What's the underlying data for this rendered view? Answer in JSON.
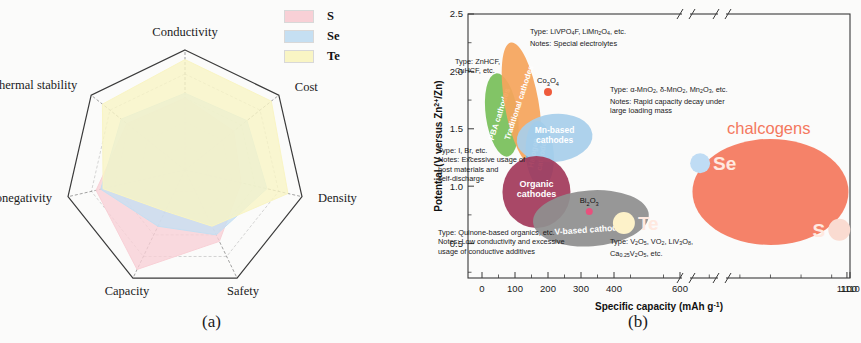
{
  "figure": {
    "panel_a_caption": "(a)",
    "panel_b_caption": "(b)"
  },
  "panel_a": {
    "type": "radar",
    "legend": [
      {
        "name": "S",
        "color": "#f8d0d6"
      },
      {
        "name": "Se",
        "color": "#c5dff2"
      },
      {
        "name": "Te",
        "color": "#f9f5c4"
      }
    ],
    "axes": [
      "Conductivity",
      "Cost",
      "Density",
      "Safety",
      "Capacity",
      "Electronegativity",
      "Thermal stability"
    ]
  },
  "panel_b": {
    "y_axis_title": "Potential (V versus Zn",
    "y_axis_title_sup": "2+",
    "y_axis_title_tail": "/Zn)",
    "x_axis_title": "Specific capacity (mAh g",
    "x_axis_title_sup": "-1",
    "x_axis_title_tail": ")",
    "x_ticks": [
      "0",
      "100",
      "200",
      "300",
      "400",
      "600",
      "1100",
      "1110"
    ],
    "y_ticks": [
      "0.5",
      "1.0",
      "1.5",
      "2.0",
      "2.5"
    ],
    "chalcogens_title": "chalcogens",
    "bubbles": [
      {
        "label": "PBA cathodes",
        "color": "#79c05a"
      },
      {
        "label": "Traditional cathodes",
        "color": "#f5a55c"
      },
      {
        "label": "Halogen cathodes",
        "color": "#62b8e8"
      },
      {
        "label": "Mn-based cathodes",
        "color": "#a8cfeb"
      },
      {
        "label": "Organic cathodes",
        "color": "#a33a5b"
      },
      {
        "label": "V-based cathodes",
        "color": "#8f8f8f"
      },
      {
        "label": "chalcogens",
        "color": "#f4785e"
      }
    ],
    "points": [
      {
        "label": "Co3O4",
        "color": "#ef5b3c"
      },
      {
        "label": "Bi2O3",
        "color": "#e8507d"
      },
      {
        "label": "Se",
        "color": "#bfdcf4"
      },
      {
        "label": "Te",
        "color": "#fdf2c9"
      },
      {
        "label": "S",
        "color": "#fadbd1"
      }
    ],
    "annotations": [
      {
        "id": "pba",
        "text": "Type: ZnHCF,\nCuHCF, etc."
      },
      {
        "id": "traditional",
        "text": "Type: LiVPO4F, LiMn2O4, etc.\nNotes: Special electrolytes"
      },
      {
        "id": "mn",
        "text": "Type: a-MnO2, d-MnO2, Mn2O3, etc.\nNotes: Rapid capacity decay under\nlarge loading mass"
      },
      {
        "id": "halogen",
        "text": "Type: I, Br, etc.\nNotes: Excessive usage of\nhost materials and\nself-discharge"
      },
      {
        "id": "organic",
        "text": "Type: Quinone-based organics, etc.\nNotes: Low conductivity and excessive\nusage of conductive additives"
      },
      {
        "id": "vanadium",
        "text": "Type: V2O5, VO2, LiV3O8,\nCa0.25V2O5, etc."
      }
    ]
  },
  "chart_data": [
    {
      "type": "radar",
      "title": "",
      "categories": [
        "Conductivity",
        "Cost",
        "Density",
        "Safety",
        "Capacity",
        "Electronegativity",
        "Thermal stability"
      ],
      "rmax": 5,
      "grid": true,
      "legend_position": "top-right",
      "series": [
        {
          "name": "S",
          "color": "#f8d0d6",
          "values": [
            3.0,
            2.6,
            2.4,
            3.3,
            4.6,
            3.8,
            3.1
          ]
        },
        {
          "name": "Se",
          "color": "#c5dff2",
          "values": [
            3.2,
            3.3,
            3.5,
            3.0,
            2.6,
            3.6,
            3.4
          ]
        },
        {
          "name": "Te",
          "color": "#f9f5c4",
          "values": [
            4.6,
            4.6,
            4.4,
            2.6,
            1.9,
            3.5,
            4.4
          ]
        }
      ]
    },
    {
      "type": "scatter",
      "title": "",
      "xlabel": "Specific capacity (mAh g-1)",
      "ylabel": "Potential (V versus Zn2+/Zn)",
      "xlim": [
        -40,
        1110
      ],
      "ylim": [
        0.2,
        2.5
      ],
      "x_ticks": [
        0,
        100,
        200,
        300,
        400,
        600,
        1100,
        1110
      ],
      "y_ticks": [
        0.5,
        1.0,
        1.5,
        2.0,
        2.5
      ],
      "axis_breaks": [
        "after 600",
        "before 1100"
      ],
      "grid": false,
      "legend_position": "none",
      "bubbles": [
        {
          "name": "PBA cathodes",
          "x": 60,
          "y": 1.62,
          "color": "#79c05a"
        },
        {
          "name": "Traditional cathodes",
          "x": 120,
          "y": 1.72,
          "color": "#f5a55c"
        },
        {
          "name": "Halogen cathodes",
          "x": 175,
          "y": 1.28,
          "color": "#62b8e8"
        },
        {
          "name": "Mn-based cathodes",
          "x": 220,
          "y": 1.42,
          "color": "#a8cfeb"
        },
        {
          "name": "Organic cathodes",
          "x": 165,
          "y": 0.95,
          "color": "#a33a5b"
        },
        {
          "name": "V-based cathodes",
          "x": 330,
          "y": 0.72,
          "color": "#8f8f8f"
        },
        {
          "name": "chalcogens",
          "x": 850,
          "y": 0.95,
          "color": "#f4785e"
        }
      ],
      "points": [
        {
          "name": "Co3O4",
          "x": 200,
          "y": 1.82,
          "color": "#ef5b3c"
        },
        {
          "name": "Bi2O3",
          "x": 325,
          "y": 0.78,
          "color": "#e8507d"
        },
        {
          "name": "Se",
          "x": 620,
          "y": 1.2,
          "color": "#bfdcf4"
        },
        {
          "name": "Te",
          "x": 430,
          "y": 0.68,
          "color": "#fdf2c9"
        },
        {
          "name": "S",
          "x": 1075,
          "y": 0.62,
          "color": "#fadbd1"
        }
      ]
    }
  ]
}
